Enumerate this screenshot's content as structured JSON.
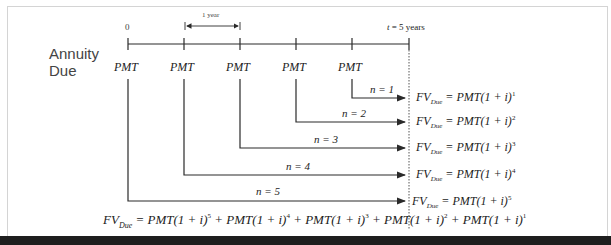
{
  "diagram": {
    "title": "Annuity Due",
    "title_lines": [
      "Annuity",
      "Due"
    ],
    "timeline": {
      "start_label": "0",
      "end_label_var": "t",
      "end_label_rest": " = 5 years",
      "interval_label": "1 year",
      "payment_label": "PMT",
      "payments": [
        "PMT",
        "PMT",
        "PMT",
        "PMT",
        "PMT"
      ]
    },
    "rows": [
      {
        "n_label": "n = 1",
        "fv": "FV",
        "sub": "Due",
        "rhs": " = PMT(1 + i)",
        "exp": "1"
      },
      {
        "n_label": "n = 2",
        "fv": "FV",
        "sub": "Due",
        "rhs": " = PMT(1 + i)",
        "exp": "2"
      },
      {
        "n_label": "n = 3",
        "fv": "FV",
        "sub": "Due",
        "rhs": " = PMT(1 + i)",
        "exp": "3"
      },
      {
        "n_label": "n = 4",
        "fv": "FV",
        "sub": "Due",
        "rhs": " = PMT(1 + i)",
        "exp": "4"
      },
      {
        "n_label": "n = 5",
        "fv": "FV",
        "sub": "Due",
        "rhs": " = PMT(1 + i)",
        "exp": "5"
      }
    ],
    "sum": {
      "fv": "FV",
      "sub": "Due",
      "terms": [
        {
          "text": " = PMT(1 + i)",
          "exp": "5"
        },
        {
          "text": " + PMT(1 + i)",
          "exp": "4"
        },
        {
          "text": " + PMT(1 + i)",
          "exp": "3"
        },
        {
          "text": " + PMT(1 + i)",
          "exp": "2"
        },
        {
          "text": " + PMT(1 + i)",
          "exp": "1"
        }
      ]
    },
    "colors": {
      "line": "#2a2a2a",
      "border": "#d4d4d4",
      "bar": "#1e1e1e"
    }
  }
}
